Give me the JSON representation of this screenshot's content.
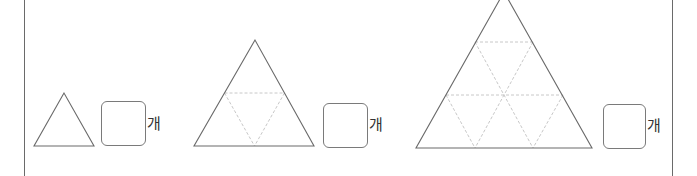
{
  "problems": [
    {
      "unit_label": "개",
      "small_triangles_per_side": 1
    },
    {
      "unit_label": "개",
      "small_triangles_per_side": 2
    },
    {
      "unit_label": "개",
      "small_triangles_per_side": 3
    }
  ],
  "colors": {
    "outline": "#6a6a6a",
    "dashed": "#c8c8c8",
    "border": "#6a6a6a"
  }
}
